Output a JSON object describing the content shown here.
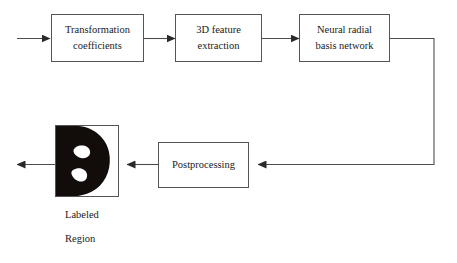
{
  "diagram": {
    "line_color": "#4d4d4d",
    "box_border_color": "#555555",
    "text_color": "#1a1a1a",
    "shape_fill": "#120c0a",
    "hole_fill": "#ffffff",
    "background": "#ffffff"
  },
  "nodes": {
    "transformation": {
      "line1": "Transformation",
      "line2": "coefficients"
    },
    "feature_extraction": {
      "line1": "3D feature",
      "line2": "extraction"
    },
    "neural_network": {
      "line1": "Neural radial",
      "line2": "basis network"
    },
    "postprocessing": {
      "line1": "Postprocessing"
    },
    "labeled_region": {
      "caption_line1": "Labeled",
      "caption_line2": "Region"
    }
  },
  "edges": [
    {
      "name": "input-arrow",
      "from": "input",
      "to": "transformation"
    },
    {
      "name": "transformation-to-feature",
      "from": "transformation",
      "to": "feature_extraction"
    },
    {
      "name": "feature-to-network",
      "from": "feature_extraction",
      "to": "neural_network"
    },
    {
      "name": "network-to-postprocessing",
      "from": "neural_network",
      "to": "postprocessing"
    },
    {
      "name": "postprocessing-to-region",
      "from": "postprocessing",
      "to": "labeled_region"
    },
    {
      "name": "output-arrow",
      "from": "labeled_region",
      "to": "output"
    }
  ]
}
